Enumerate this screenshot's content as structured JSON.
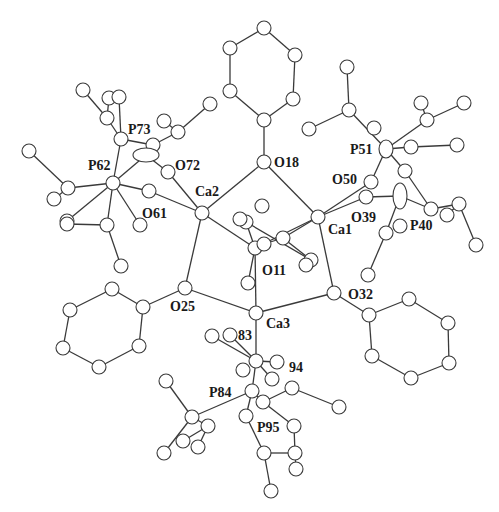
{
  "colors": {
    "line": "#3a3a3a",
    "atom_fill": "#ffffff",
    "text": "#1a1a1a"
  },
  "labels": [
    {
      "id": "Ca1",
      "text": "Ca1",
      "x": 328,
      "y": 234
    },
    {
      "id": "Ca2",
      "text": "Ca2",
      "x": 195,
      "y": 196
    },
    {
      "id": "Ca3",
      "text": "Ca3",
      "x": 266,
      "y": 328
    },
    {
      "id": "O11",
      "text": "O11",
      "x": 262,
      "y": 275
    },
    {
      "id": "O18",
      "text": "O18",
      "x": 274,
      "y": 167
    },
    {
      "id": "O25",
      "text": "O25",
      "x": 170,
      "y": 311
    },
    {
      "id": "O32",
      "text": "O32",
      "x": 348,
      "y": 299
    },
    {
      "id": "O39",
      "text": "O39",
      "x": 351,
      "y": 222
    },
    {
      "id": "O40",
      "text": "P40",
      "x": 410,
      "y": 230
    },
    {
      "id": "O50",
      "text": "O50",
      "x": 332,
      "y": 184
    },
    {
      "id": "P51",
      "text": "P51",
      "x": 350,
      "y": 154
    },
    {
      "id": "O61",
      "text": "O61",
      "x": 142,
      "y": 218
    },
    {
      "id": "P62",
      "text": "P62",
      "x": 88,
      "y": 170
    },
    {
      "id": "O72",
      "text": "O72",
      "x": 175,
      "y": 170
    },
    {
      "id": "P73",
      "text": "P73",
      "x": 128,
      "y": 134
    },
    {
      "id": "L83",
      "text": "83",
      "x": 238,
      "y": 340
    },
    {
      "id": "L94",
      "text": "94",
      "x": 289,
      "y": 372
    },
    {
      "id": "P84",
      "text": "P84",
      "x": 209,
      "y": 397
    },
    {
      "id": "P95",
      "text": "P95",
      "x": 257,
      "y": 432
    }
  ],
  "atoms": [
    {
      "id": "Ca1",
      "x": 318,
      "y": 217,
      "r": 7
    },
    {
      "id": "Ca2",
      "x": 202,
      "y": 213,
      "r": 7
    },
    {
      "id": "Ca3",
      "x": 256,
      "y": 313,
      "r": 7
    },
    {
      "id": "O11",
      "x": 255,
      "y": 248,
      "r": 7
    },
    {
      "id": "O18",
      "x": 264,
      "y": 162,
      "r": 7
    },
    {
      "id": "O25",
      "x": 185,
      "y": 288,
      "r": 7
    },
    {
      "id": "O32",
      "x": 334,
      "y": 293,
      "r": 7
    },
    {
      "id": "O39",
      "x": 366,
      "y": 197,
      "r": 7
    },
    {
      "id": "O50",
      "x": 371,
      "y": 182,
      "r": 7
    },
    {
      "id": "P51",
      "x": 386,
      "y": 149,
      "rx": 7,
      "ry": 9
    },
    {
      "id": "P40",
      "x": 431,
      "y": 209,
      "r": 7
    },
    {
      "id": "C40e",
      "x": 400,
      "y": 196,
      "rx": 7,
      "ry": 13
    },
    {
      "id": "O61",
      "x": 149,
      "y": 191,
      "r": 7
    },
    {
      "id": "P62",
      "x": 113,
      "y": 183,
      "r": 7
    },
    {
      "id": "O72",
      "x": 168,
      "y": 172,
      "r": 7
    },
    {
      "id": "P73",
      "x": 121,
      "y": 139,
      "r": 7
    },
    {
      "id": "r18a",
      "x": 264,
      "y": 120,
      "r": 7
    },
    {
      "id": "r18b",
      "x": 293,
      "y": 99,
      "r": 7
    },
    {
      "id": "r18c",
      "x": 295,
      "y": 55,
      "r": 7
    },
    {
      "id": "r18d",
      "x": 264,
      "y": 28,
      "r": 7
    },
    {
      "id": "r18e",
      "x": 230,
      "y": 48,
      "r": 7
    },
    {
      "id": "r18f",
      "x": 230,
      "y": 91,
      "r": 7
    },
    {
      "id": "r25a",
      "x": 143,
      "y": 307,
      "r": 7
    },
    {
      "id": "r25b",
      "x": 139,
      "y": 346,
      "r": 7
    },
    {
      "id": "r25c",
      "x": 99,
      "y": 367,
      "r": 7
    },
    {
      "id": "r25d",
      "x": 63,
      "y": 348,
      "r": 7
    },
    {
      "id": "r25e",
      "x": 70,
      "y": 310,
      "r": 7
    },
    {
      "id": "r25f",
      "x": 112,
      "y": 289,
      "r": 7
    },
    {
      "id": "r32a",
      "x": 369,
      "y": 315,
      "r": 7
    },
    {
      "id": "r32b",
      "x": 372,
      "y": 356,
      "r": 7
    },
    {
      "id": "r32c",
      "x": 411,
      "y": 378,
      "r": 7
    },
    {
      "id": "r32d",
      "x": 449,
      "y": 363,
      "r": 7
    },
    {
      "id": "r32e",
      "x": 448,
      "y": 323,
      "r": 7
    },
    {
      "id": "r32f",
      "x": 409,
      "y": 299,
      "r": 7
    },
    {
      "id": "r11a",
      "x": 264,
      "y": 244,
      "r": 7
    },
    {
      "id": "r11b",
      "x": 283,
      "y": 238,
      "r": 7
    },
    {
      "id": "r11c",
      "x": 311,
      "y": 260,
      "r": 7
    },
    {
      "id": "r11d",
      "x": 306,
      "y": 265,
      "r": 7
    },
    {
      "id": "r11e",
      "x": 246,
      "y": 222,
      "r": 7
    },
    {
      "id": "r11f",
      "x": 240,
      "y": 219,
      "r": 7
    },
    {
      "id": "r11g",
      "x": 262,
      "y": 206,
      "r": 7
    },
    {
      "id": "r11h",
      "x": 248,
      "y": 283,
      "r": 7
    },
    {
      "id": "p62a",
      "x": 68,
      "y": 188,
      "r": 7
    },
    {
      "id": "p62b",
      "x": 29,
      "y": 151,
      "r": 7
    },
    {
      "id": "p62c",
      "x": 54,
      "y": 199,
      "r": 7
    },
    {
      "id": "p62d",
      "x": 67,
      "y": 221,
      "r": 7
    },
    {
      "id": "p62e",
      "x": 107,
      "y": 225,
      "r": 7
    },
    {
      "id": "p62f",
      "x": 67,
      "y": 224,
      "r": 7
    },
    {
      "id": "p62g",
      "x": 121,
      "y": 266,
      "r": 7
    },
    {
      "id": "p62h",
      "x": 140,
      "y": 225,
      "r": 7
    },
    {
      "id": "p73a",
      "x": 107,
      "y": 118,
      "r": 7
    },
    {
      "id": "p73b",
      "x": 83,
      "y": 90,
      "r": 7
    },
    {
      "id": "p73c",
      "x": 109,
      "y": 98,
      "r": 7
    },
    {
      "id": "p73d",
      "x": 119,
      "y": 97,
      "r": 7
    },
    {
      "id": "p73e",
      "x": 153,
      "y": 145,
      "r": 7
    },
    {
      "id": "p73f",
      "x": 178,
      "y": 132,
      "r": 7
    },
    {
      "id": "p73g",
      "x": 164,
      "y": 121,
      "r": 7
    },
    {
      "id": "p73h",
      "x": 210,
      "y": 104,
      "r": 7
    },
    {
      "id": "p73i",
      "x": 146,
      "y": 155,
      "rx": 13,
      "ry": 7
    },
    {
      "id": "p51a",
      "x": 349,
      "y": 110,
      "r": 7
    },
    {
      "id": "p51b",
      "x": 347,
      "y": 67,
      "r": 7
    },
    {
      "id": "p51c",
      "x": 309,
      "y": 129,
      "r": 7
    },
    {
      "id": "p51d",
      "x": 374,
      "y": 128,
      "r": 7
    },
    {
      "id": "p51e",
      "x": 427,
      "y": 120,
      "r": 7
    },
    {
      "id": "p51f",
      "x": 421,
      "y": 103,
      "r": 7
    },
    {
      "id": "p51g",
      "x": 464,
      "y": 103,
      "r": 7
    },
    {
      "id": "p51h",
      "x": 411,
      "y": 147,
      "r": 7
    },
    {
      "id": "p51i",
      "x": 457,
      "y": 145,
      "r": 7
    },
    {
      "id": "p51j",
      "x": 405,
      "y": 171,
      "r": 7
    },
    {
      "id": "p40a",
      "x": 447,
      "y": 215,
      "r": 7
    },
    {
      "id": "p40b",
      "x": 459,
      "y": 204,
      "r": 7
    },
    {
      "id": "p40c",
      "x": 476,
      "y": 245,
      "r": 7
    },
    {
      "id": "p40d",
      "x": 386,
      "y": 233,
      "r": 7
    },
    {
      "id": "p40e",
      "x": 400,
      "y": 226,
      "r": 7
    },
    {
      "id": "p40f",
      "x": 368,
      "y": 275,
      "r": 7
    },
    {
      "id": "b83a",
      "x": 212,
      "y": 336,
      "r": 7
    },
    {
      "id": "b83b",
      "x": 230,
      "y": 335,
      "r": 7
    },
    {
      "id": "b94a",
      "x": 256,
      "y": 361,
      "r": 7
    },
    {
      "id": "b94b",
      "x": 243,
      "y": 370,
      "r": 7
    },
    {
      "id": "b94c",
      "x": 277,
      "y": 362,
      "r": 7
    },
    {
      "id": "b94d",
      "x": 272,
      "y": 379,
      "r": 7
    },
    {
      "id": "p84a",
      "x": 252,
      "y": 391,
      "r": 7
    },
    {
      "id": "p84b",
      "x": 263,
      "y": 402,
      "r": 7
    },
    {
      "id": "p84c",
      "x": 292,
      "y": 388,
      "r": 7
    },
    {
      "id": "p84d",
      "x": 339,
      "y": 407,
      "r": 7
    },
    {
      "id": "p84e",
      "x": 294,
      "y": 426,
      "r": 7
    },
    {
      "id": "p84f",
      "x": 192,
      "y": 417,
      "r": 7
    },
    {
      "id": "p84g",
      "x": 166,
      "y": 381,
      "r": 7
    },
    {
      "id": "p84h",
      "x": 208,
      "y": 426,
      "r": 7
    },
    {
      "id": "p84i",
      "x": 183,
      "y": 441,
      "r": 7
    },
    {
      "id": "p84j",
      "x": 198,
      "y": 447,
      "r": 7
    },
    {
      "id": "p84k",
      "x": 164,
      "y": 453,
      "r": 7
    },
    {
      "id": "p95a",
      "x": 246,
      "y": 416,
      "r": 7
    },
    {
      "id": "p95b",
      "x": 264,
      "y": 453,
      "r": 7
    },
    {
      "id": "p95c",
      "x": 295,
      "y": 453,
      "r": 7
    },
    {
      "id": "p95d",
      "x": 296,
      "y": 469,
      "r": 7
    },
    {
      "id": "p95e",
      "x": 271,
      "y": 491,
      "r": 7
    }
  ],
  "bonds": [
    [
      "Ca2",
      "O18"
    ],
    [
      "O18",
      "Ca1"
    ],
    [
      "Ca2",
      "O25"
    ],
    [
      "O25",
      "Ca3"
    ],
    [
      "Ca3",
      "O32"
    ],
    [
      "O32",
      "Ca1"
    ],
    [
      "Ca2",
      "O11"
    ],
    [
      "Ca1",
      "O11"
    ],
    [
      "Ca3",
      "O11"
    ],
    [
      "Ca2",
      "O61"
    ],
    [
      "Ca2",
      "O72"
    ],
    [
      "Ca1",
      "O50"
    ],
    [
      "Ca1",
      "O39"
    ],
    [
      "O18",
      "r18a"
    ],
    [
      "r18a",
      "r18b"
    ],
    [
      "r18b",
      "r18c"
    ],
    [
      "r18c",
      "r18d"
    ],
    [
      "r18d",
      "r18e"
    ],
    [
      "r18e",
      "r18f"
    ],
    [
      "r18f",
      "r18a"
    ],
    [
      "O25",
      "r25a"
    ],
    [
      "r25a",
      "r25b"
    ],
    [
      "r25b",
      "r25c"
    ],
    [
      "r25c",
      "r25d"
    ],
    [
      "r25d",
      "r25e"
    ],
    [
      "r25e",
      "r25f"
    ],
    [
      "r25f",
      "r25a"
    ],
    [
      "O32",
      "r32a"
    ],
    [
      "r32a",
      "r32b"
    ],
    [
      "r32b",
      "r32c"
    ],
    [
      "r32c",
      "r32d"
    ],
    [
      "r32d",
      "r32e"
    ],
    [
      "r32e",
      "r32f"
    ],
    [
      "r32f",
      "r32a"
    ],
    [
      "O11",
      "r11a"
    ],
    [
      "r11a",
      "r11b"
    ],
    [
      "r11b",
      "r11c"
    ],
    [
      "r11c",
      "r11d"
    ],
    [
      "O11",
      "r11e"
    ],
    [
      "r11e",
      "r11f"
    ],
    [
      "r11b",
      "Ca1"
    ],
    [
      "r11e",
      "r11c"
    ],
    [
      "O11",
      "r11h"
    ],
    [
      "O61",
      "P62"
    ],
    [
      "P62",
      "p62a"
    ],
    [
      "p62a",
      "p62b"
    ],
    [
      "p62a",
      "p62c"
    ],
    [
      "P62",
      "p62d"
    ],
    [
      "P62",
      "p62e"
    ],
    [
      "p62e",
      "p62f"
    ],
    [
      "p62e",
      "p62g"
    ],
    [
      "P62",
      "p62h"
    ],
    [
      "P62",
      "P73"
    ],
    [
      "P62",
      "p73i"
    ],
    [
      "O72",
      "p73i"
    ],
    [
      "P73",
      "p73a"
    ],
    [
      "p73a",
      "p73b"
    ],
    [
      "p73a",
      "p73c"
    ],
    [
      "P73",
      "p73d"
    ],
    [
      "P73",
      "p73e"
    ],
    [
      "p73e",
      "p73f"
    ],
    [
      "p73f",
      "p73g"
    ],
    [
      "p73f",
      "p73h"
    ],
    [
      "O50",
      "P51"
    ],
    [
      "P51",
      "p51a"
    ],
    [
      "p51a",
      "p51b"
    ],
    [
      "p51a",
      "p51c"
    ],
    [
      "P51",
      "p51e"
    ],
    [
      "p51e",
      "p51f"
    ],
    [
      "p51e",
      "p51g"
    ],
    [
      "P51",
      "p51h"
    ],
    [
      "p51h",
      "p51i"
    ],
    [
      "P51",
      "p51j"
    ],
    [
      "O39",
      "C40e"
    ],
    [
      "C40e",
      "P40"
    ],
    [
      "p51j",
      "P40"
    ],
    [
      "P40",
      "p40b"
    ],
    [
      "p40b",
      "p40a"
    ],
    [
      "p40b",
      "p40c"
    ],
    [
      "C40e",
      "p40d"
    ],
    [
      "p40d",
      "p40f"
    ],
    [
      "Ca3",
      "b94a"
    ],
    [
      "b83a",
      "b94a"
    ],
    [
      "b83b",
      "b94a"
    ],
    [
      "b94a",
      "b94c"
    ],
    [
      "b94a",
      "b94d"
    ],
    [
      "b94a",
      "p84a"
    ],
    [
      "p84a",
      "p84b"
    ],
    [
      "p84b",
      "p84c"
    ],
    [
      "p84c",
      "p84d"
    ],
    [
      "p84b",
      "p84e"
    ],
    [
      "p84a",
      "p84f"
    ],
    [
      "p84f",
      "p84g"
    ],
    [
      "p84f",
      "p84h"
    ],
    [
      "p84h",
      "p84i"
    ],
    [
      "p84h",
      "p84j"
    ],
    [
      "p84f",
      "p84k"
    ],
    [
      "p84a",
      "p95a"
    ],
    [
      "p95a",
      "p95b"
    ],
    [
      "p95b",
      "p95c"
    ],
    [
      "p95c",
      "p84e"
    ],
    [
      "p95c",
      "p95d"
    ],
    [
      "p95b",
      "p95e"
    ]
  ]
}
